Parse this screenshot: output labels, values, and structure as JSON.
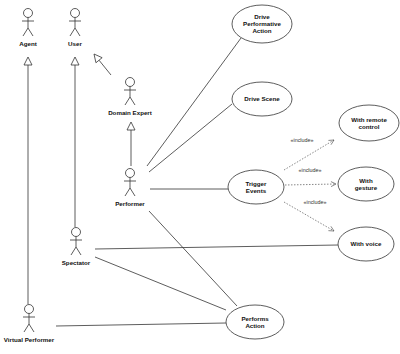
{
  "diagram": {
    "type": "uml-use-case",
    "stroke_color": "#333333",
    "background": "#ffffff"
  },
  "actors": [
    {
      "id": "agent",
      "label": "Agent",
      "x": 28,
      "y": 8
    },
    {
      "id": "user",
      "label": "User",
      "x": 75,
      "y": 8
    },
    {
      "id": "domain_expert",
      "label": "Domain Expert",
      "x": 130,
      "y": 77
    },
    {
      "id": "performer",
      "label": "Performer",
      "x": 130,
      "y": 168
    },
    {
      "id": "spectator",
      "label": "Spectator",
      "x": 76,
      "y": 227
    },
    {
      "id": "virtual_performer",
      "label": "Virtual Performer",
      "x": 29,
      "y": 304
    }
  ],
  "use_cases": [
    {
      "id": "drive_performative_action",
      "lines": [
        "Drive",
        "Performative",
        "Action"
      ],
      "cx": 262,
      "cy": 24,
      "rx": 30,
      "ry": 19
    },
    {
      "id": "drive_scene",
      "lines": [
        "Drive Scene"
      ],
      "cx": 262,
      "cy": 99,
      "rx": 30,
      "ry": 17
    },
    {
      "id": "with_remote_control",
      "lines": [
        "With remote",
        "control"
      ],
      "cx": 369,
      "cy": 123,
      "rx": 30,
      "ry": 18
    },
    {
      "id": "trigger_events",
      "lines": [
        "Trigger",
        "Events"
      ],
      "cx": 256,
      "cy": 187,
      "rx": 28,
      "ry": 17
    },
    {
      "id": "with_gesture",
      "lines": [
        "With",
        "gesture"
      ],
      "cx": 366,
      "cy": 184,
      "rx": 28,
      "ry": 17
    },
    {
      "id": "with_voice",
      "lines": [
        "With voice"
      ],
      "cx": 366,
      "cy": 244,
      "rx": 28,
      "ry": 17
    },
    {
      "id": "performs_action",
      "lines": [
        "Performs",
        "Action"
      ],
      "cx": 255,
      "cy": 322,
      "rx": 29,
      "ry": 17
    }
  ],
  "generalizations": [
    {
      "from": "virtual_performer",
      "to": "agent",
      "x1": 28,
      "y1": 304,
      "x2": 28,
      "y2": 57
    },
    {
      "from": "spectator",
      "to": "user",
      "x1": 75,
      "y1": 227,
      "x2": 75,
      "y2": 57
    },
    {
      "from": "domain_expert",
      "to": "user",
      "x1": 111,
      "y1": 75,
      "x2": 94,
      "y2": 54
    },
    {
      "from": "performer",
      "to": "domain_expert",
      "x1": 131,
      "y1": 166,
      "x2": 131,
      "y2": 122
    }
  ],
  "associations": [
    {
      "from": "performer",
      "to": "drive_performative_action",
      "x1": 147,
      "y1": 166,
      "x2": 241,
      "y2": 38
    },
    {
      "from": "performer",
      "to": "drive_scene",
      "x1": 149,
      "y1": 172,
      "x2": 232,
      "y2": 104
    },
    {
      "from": "performer",
      "to": "trigger_events",
      "x1": 150,
      "y1": 189,
      "x2": 228,
      "y2": 189
    },
    {
      "from": "performer",
      "to": "performs_action",
      "x1": 149,
      "y1": 211,
      "x2": 237,
      "y2": 306
    },
    {
      "from": "spectator",
      "to": "with_voice",
      "x1": 95,
      "y1": 249,
      "x2": 338,
      "y2": 245
    },
    {
      "from": "spectator",
      "to": "performs_action",
      "x1": 95,
      "y1": 257,
      "x2": 226,
      "y2": 310
    },
    {
      "from": "virtual_performer",
      "to": "performs_action",
      "x1": 56,
      "y1": 326,
      "x2": 226,
      "y2": 323
    }
  ],
  "includes": [
    {
      "from": "trigger_events",
      "to": "with_remote_control",
      "label": "«include»",
      "x1": 284,
      "y1": 170,
      "x2": 334,
      "y2": 140,
      "lx": 302,
      "ly": 142
    },
    {
      "from": "trigger_events",
      "to": "with_gesture",
      "label": "«include»",
      "x1": 285,
      "y1": 185,
      "x2": 336,
      "y2": 184,
      "lx": 310,
      "ly": 172
    },
    {
      "from": "trigger_events",
      "to": "with_voice",
      "label": "«include»",
      "x1": 284,
      "y1": 202,
      "x2": 334,
      "y2": 231,
      "lx": 315,
      "ly": 204
    }
  ]
}
